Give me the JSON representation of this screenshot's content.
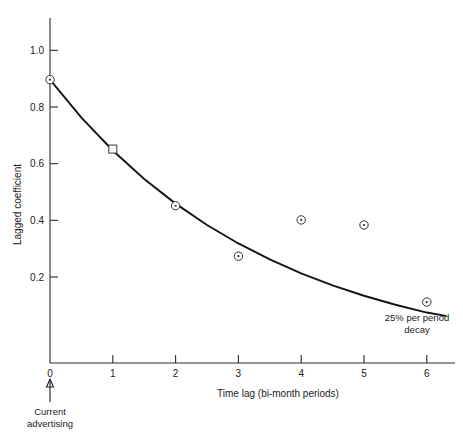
{
  "chart_data": {
    "type": "scatter",
    "title": "",
    "xlabel": "Time lag (bi-month periods)",
    "ylabel": "Lagged coefficient",
    "xlim": [
      0,
      6.4
    ],
    "ylim": [
      0,
      1.08
    ],
    "grid": false,
    "legend": "none",
    "x_ticks": [
      "0",
      "1",
      "2",
      "3",
      "4",
      "5",
      "6"
    ],
    "x_tick_values": [
      0,
      1,
      2,
      3,
      4,
      5,
      6
    ],
    "y_ticks": [
      "0.2",
      "0.4",
      "0.6",
      "0.8",
      "1.0"
    ],
    "y_tick_values": [
      0.2,
      0.4,
      0.6,
      0.8,
      1.0
    ],
    "series": [
      {
        "name": "Estimated lagged coefficients",
        "marker": "open-circle",
        "x": [
          0,
          2,
          3,
          4,
          5,
          6
        ],
        "values": [
          1.0,
          0.555,
          0.377,
          0.505,
          0.487,
          0.215
        ]
      },
      {
        "name": "Lagged coefficient (square marker)",
        "marker": "open-square",
        "x": [
          1
        ],
        "values": [
          0.755
        ]
      },
      {
        "name": "25% per period decay",
        "marker": "none",
        "curve": "exponential",
        "decay_rate_per_period": 0.25,
        "x": [
          0,
          0.5,
          1,
          1.5,
          2,
          2.5,
          3,
          3.5,
          4,
          4.5,
          5,
          5.5,
          6,
          6.3
        ],
        "values": [
          1.0,
          0.866,
          0.75,
          0.6495,
          0.5625,
          0.4871,
          0.4219,
          0.3654,
          0.3164,
          0.274,
          0.2373,
          0.2055,
          0.178,
          0.1664
        ]
      }
    ],
    "annotations": [
      {
        "name": "decay-annotation",
        "line1": "25% per period",
        "line2": "decay",
        "x_px": 417,
        "y_px": 320
      },
      {
        "name": "current-advertising-annotation",
        "line1": "Current",
        "line2": "advertising",
        "x_value": 0,
        "x_px": 50,
        "y_px": 405
      }
    ]
  },
  "axis": {
    "y_label": "Lagged coefficient",
    "x_label": "Time lag (bi-month periods)",
    "origin_label": "0"
  },
  "colors": {
    "axis": "#2b2b2b",
    "curve": "#141414",
    "marker_stroke": "#333333",
    "text": "#1a1a1a",
    "background": "#ffffff"
  }
}
